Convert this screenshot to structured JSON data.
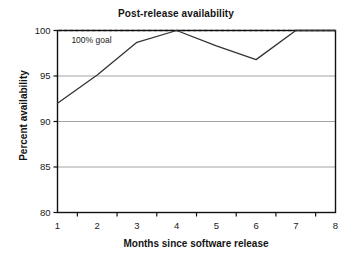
{
  "chart_data": {
    "type": "line",
    "title": "Post-release availability",
    "xlabel": "Months since software release",
    "ylabel": "Percent availability",
    "x": [
      1,
      2,
      3,
      4,
      5,
      6,
      7,
      8
    ],
    "categories": [
      "1",
      "2",
      "3",
      "4",
      "5",
      "6",
      "7",
      "8"
    ],
    "values": [
      92.0,
      95.1,
      98.7,
      100.0,
      98.3,
      96.8,
      100.0,
      100.0
    ],
    "series": [
      {
        "name": "Percent availability",
        "values": [
          92.0,
          95.1,
          98.7,
          100.0,
          98.3,
          96.8,
          100.0,
          100.0
        ]
      }
    ],
    "ylim": [
      80,
      100
    ],
    "xlim": [
      1,
      8
    ],
    "yticks": [
      80,
      85,
      90,
      95,
      100
    ],
    "ytick_labels": [
      "80",
      "85",
      "90",
      "95",
      "100"
    ],
    "xticks": [
      1,
      2,
      3,
      4,
      5,
      6,
      7,
      8
    ],
    "xtick_labels": [
      "1",
      "2",
      "3",
      "4",
      "5",
      "6",
      "7",
      "8"
    ],
    "grid": true,
    "grid_axis": "y",
    "legend": "none",
    "annotations": [
      {
        "text": "100% goal",
        "x": 1.35,
        "y": 98.6,
        "refers_to": "goal-line"
      }
    ],
    "reference_lines": [
      {
        "name": "100% goal",
        "value": 100,
        "orientation": "horizontal",
        "style": "dashed"
      }
    ],
    "colors": {
      "line": "#333333",
      "goal_line": "#555555",
      "grid": "#999999",
      "axis": "#111111",
      "background": "#ffffff"
    }
  }
}
